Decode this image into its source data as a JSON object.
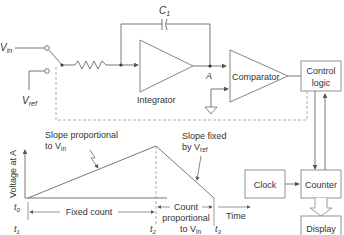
{
  "circuit": {
    "vin_label": "V",
    "vin_sub": "in",
    "vref_label": "V",
    "vref_sub": "ref",
    "capacitor_label": "C",
    "capacitor_sub": "1",
    "node_label": "A",
    "integrator_label": "Integrator",
    "comparator_label": "Comparator"
  },
  "blocks": {
    "control_logic": [
      "Control",
      "logic"
    ],
    "clock": "Clock",
    "counter": "Counter",
    "display": "Display"
  },
  "graph": {
    "ylabel": "Voltage at A",
    "xlabel": "Time",
    "slope1_line1": "Slope proportional",
    "slope1_line2": "to V",
    "slope1_sub": "in",
    "slope2_line1": "Slope fixed",
    "slope2_line2": "by V",
    "slope2_sub": "ref",
    "fixed_count": "Fixed count",
    "count_line1": "Count",
    "count_line2": "proportional",
    "count_line3": "to V",
    "count_sub": "in",
    "t0": "t",
    "t0_sub": "0",
    "t1": "t",
    "t1_sub": "1",
    "t2": "t",
    "t2_sub": "2",
    "t3": "t",
    "t3_sub": "3"
  },
  "colors": {
    "line": "#555555",
    "dashed": "#999999",
    "text": "#333333"
  }
}
